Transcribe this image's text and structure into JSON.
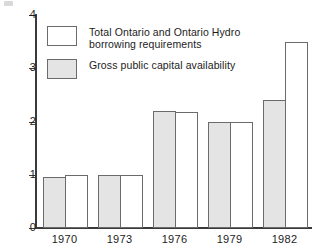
{
  "chart_data": {
    "type": "bar",
    "title": "",
    "subtitle": "",
    "xlabel": "",
    "ylabel": "",
    "categories": [
      "1970",
      "1973",
      "1976",
      "1979",
      "1982"
    ],
    "series": [
      {
        "name": "Gross public capital availability",
        "key": "gross",
        "style": "shaded",
        "values": [
          0.96,
          1.0,
          2.2,
          2.0,
          2.4
        ]
      },
      {
        "name": "Total Ontario and Ontario Hydro borrowing requirements",
        "key": "borrow",
        "style": "white",
        "values": [
          1.0,
          1.0,
          2.17,
          2.0,
          3.5
        ]
      }
    ],
    "ylim": [
      0,
      4
    ],
    "yticks": [
      0,
      1,
      2,
      3,
      4
    ],
    "ytick_labels": [
      "0",
      "1",
      "2",
      "3",
      "4"
    ],
    "grid": false,
    "legend_position": "upper-left-inside",
    "bar_order": [
      "gross",
      "borrow"
    ],
    "annotations": []
  },
  "legend": {
    "items": [
      {
        "swatch": "white",
        "label": "Total Ontario and Ontario Hydro\nborrowing requirements"
      },
      {
        "swatch": "shaded",
        "label": "Gross public capital availability"
      }
    ]
  },
  "colors": {
    "axis": "#3a3a3a",
    "bar_outline": "#6b6b6b",
    "shaded_fill": "#e4e4e4",
    "white_fill": "#ffffff",
    "text": "#1c1c1c"
  }
}
